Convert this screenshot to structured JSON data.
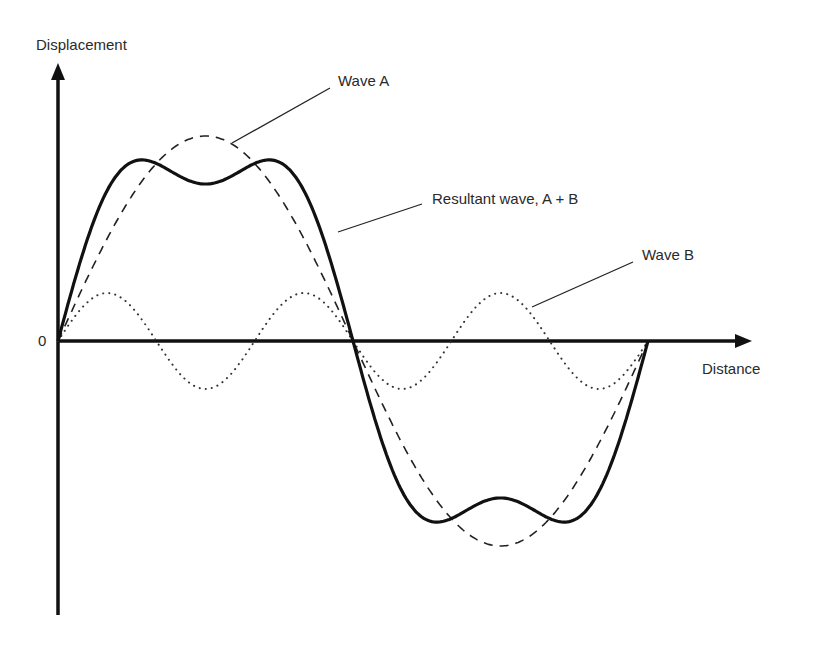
{
  "chart_data": {
    "type": "line",
    "title": "",
    "xlabel": "Distance",
    "ylabel": "Displacement",
    "origin_label": "0",
    "grid": false,
    "legend": "callout labels with leader lines",
    "x_range": [
      0,
      1
    ],
    "y_range": [
      -1.35,
      1.35
    ],
    "series": [
      {
        "name": "Wave A",
        "style": "dashed",
        "formula": "sin(2*pi*x)",
        "amplitude": 1.0,
        "frequency": 1
      },
      {
        "name": "Wave B",
        "style": "dotted",
        "formula": "0.234*sin(6*pi*x)",
        "amplitude": 0.234,
        "frequency": 3
      },
      {
        "name": "Resultant wave, A + B",
        "style": "solid-bold",
        "formula": "sin(2*pi*x) + 0.234*sin(6*pi*x)"
      }
    ],
    "annotations": [
      "Wave A",
      "Resultant wave, A + B",
      "Wave B"
    ]
  },
  "labels": {
    "y_axis": "Displacement",
    "x_axis": "Distance",
    "origin": "0",
    "wave_a": "Wave A",
    "resultant": "Resultant wave, A + B",
    "wave_b": "Wave B"
  },
  "geometry": {
    "origin_x": 58,
    "origin_y": 341,
    "period_px": 590,
    "amp_a_px": 205,
    "amp_b_px": 48,
    "colors": {
      "ink": "#111111",
      "label": "#2a2a2a",
      "background": "#ffffff"
    }
  }
}
